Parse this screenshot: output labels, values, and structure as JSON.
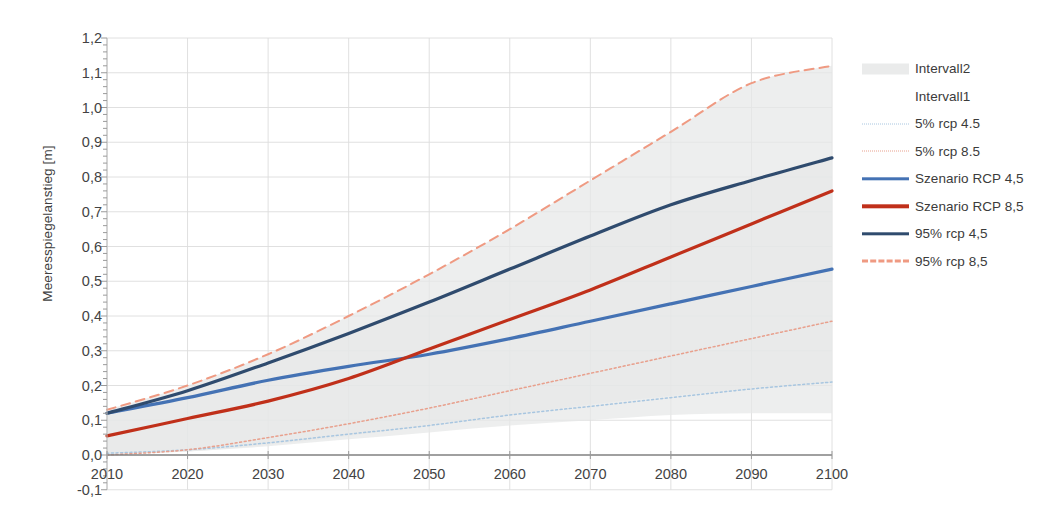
{
  "chart_data": {
    "type": "line",
    "title": "",
    "xlabel": "",
    "ylabel": "Meeresspiegelanstieg [m]",
    "xlim": [
      2010,
      2100
    ],
    "ylim": [
      -0.1,
      1.2
    ],
    "grid": true,
    "legend_position": "right",
    "x_ticks": [
      "2010",
      "2020",
      "2030",
      "2040",
      "2050",
      "2060",
      "2070",
      "2080",
      "2090",
      "2100"
    ],
    "y_ticks": [
      "-0,1",
      "0,0",
      "0,1",
      "0,2",
      "0,3",
      "0,4",
      "0,5",
      "0,6",
      "0,7",
      "0,8",
      "0,9",
      "1,0",
      "1,1",
      "1,2"
    ],
    "x": [
      2010,
      2020,
      2030,
      2040,
      2050,
      2060,
      2070,
      2080,
      2090,
      2100
    ],
    "series": [
      {
        "name": "Intervall2",
        "style": "band",
        "color": "#e6e7e8",
        "upper": [
          0.13,
          0.2,
          0.29,
          0.4,
          0.52,
          0.65,
          0.79,
          0.93,
          1.07,
          1.12
        ],
        "lower": [
          0.0,
          0.01,
          0.025,
          0.045,
          0.065,
          0.085,
          0.1,
          0.115,
          0.12,
          0.12
        ]
      },
      {
        "name": "Intervall1",
        "style": "band",
        "color": "#e6e7e8",
        "upper": [
          0.12,
          0.185,
          0.265,
          0.35,
          0.44,
          0.535,
          0.63,
          0.72,
          0.79,
          0.855
        ],
        "lower": [
          0.005,
          0.01,
          0.03,
          0.055,
          0.085,
          0.115,
          0.145,
          0.17,
          0.19,
          0.21
        ]
      },
      {
        "name": "5% rcp 4.5",
        "style": "dotted",
        "color": "#a8c6e0",
        "values": [
          0.005,
          0.015,
          0.035,
          0.06,
          0.085,
          0.115,
          0.14,
          0.165,
          0.19,
          0.21
        ]
      },
      {
        "name": "5% rcp 8.5",
        "style": "dotted",
        "color": "#e8a08d",
        "values": [
          0.0,
          0.015,
          0.05,
          0.09,
          0.135,
          0.185,
          0.235,
          0.285,
          0.335,
          0.385
        ]
      },
      {
        "name": "Szenario RCP 4,5",
        "style": "solid",
        "color": "#4472b4",
        "values": [
          0.12,
          0.165,
          0.215,
          0.255,
          0.29,
          0.335,
          0.385,
          0.435,
          0.485,
          0.535
        ]
      },
      {
        "name": "Szenario RCP 8,5",
        "style": "solid",
        "color": "#c0301a",
        "values": [
          0.055,
          0.105,
          0.155,
          0.22,
          0.305,
          0.39,
          0.475,
          0.57,
          0.665,
          0.76
        ]
      },
      {
        "name": "95% rcp 4,5",
        "style": "solid",
        "color": "#2f4b6e",
        "values": [
          0.12,
          0.185,
          0.265,
          0.35,
          0.44,
          0.535,
          0.63,
          0.72,
          0.79,
          0.855
        ]
      },
      {
        "name": "95% rcp 8,5",
        "style": "dashed",
        "color": "#ef9a82",
        "values": [
          0.13,
          0.2,
          0.29,
          0.4,
          0.52,
          0.65,
          0.79,
          0.93,
          1.07,
          1.12
        ]
      }
    ]
  },
  "legend": {
    "items": [
      {
        "label": "Intervall2",
        "swatch": "band",
        "color": "#e6e7e8"
      },
      {
        "label": "Intervall1",
        "swatch": "none",
        "color": "#ffffff"
      },
      {
        "label": "5% rcp 4.5",
        "swatch": "dotted",
        "color": "#a8c6e0"
      },
      {
        "label": "5% rcp 8.5",
        "swatch": "dotted",
        "color": "#e8a08d"
      },
      {
        "label": "Szenario RCP 4,5",
        "swatch": "solid",
        "color": "#4472b4"
      },
      {
        "label": "Szenario RCP 8,5",
        "swatch": "solid",
        "color": "#c0301a"
      },
      {
        "label": "95% rcp 4,5",
        "swatch": "solid",
        "color": "#2f4b6e"
      },
      {
        "label": "95% rcp 8,5",
        "swatch": "dashed",
        "color": "#ef9a82"
      }
    ]
  },
  "axes": {
    "y_title": "Meeresspiegelanstieg [m]"
  }
}
